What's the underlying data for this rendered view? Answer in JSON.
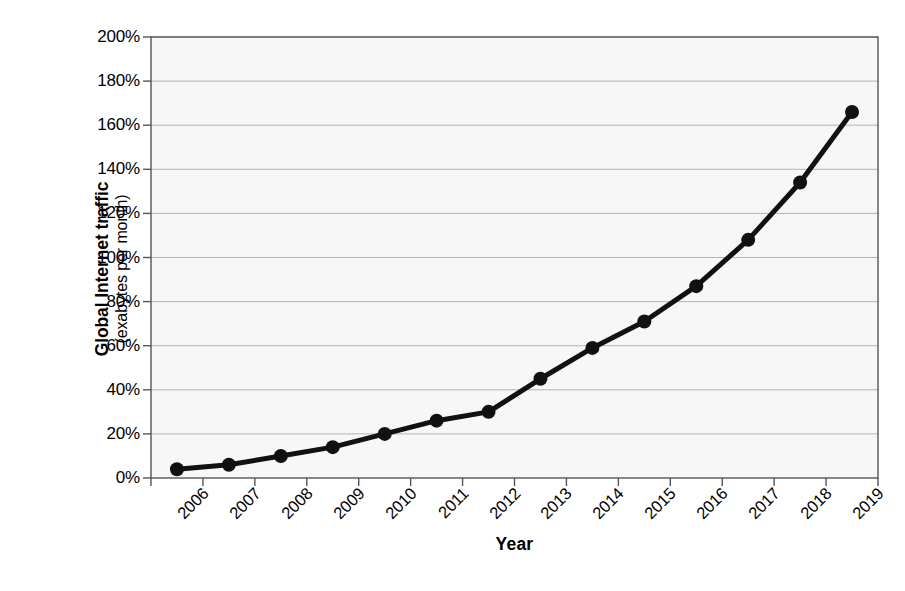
{
  "chart_data": {
    "type": "line",
    "title": "",
    "xlabel": "Year",
    "ylabel_line1": "Global Internet traffic",
    "ylabel_line2": "(exabytes per month)",
    "categories": [
      "2006",
      "2007",
      "2008",
      "2009",
      "2010",
      "2011",
      "2012",
      "2013",
      "2014",
      "2015",
      "2016",
      "2017",
      "2018",
      "2019"
    ],
    "values": [
      4,
      6,
      10,
      14,
      20,
      26,
      30,
      45,
      59,
      71,
      87,
      108,
      134,
      166
    ],
    "value_labels": [
      "4%",
      "6%",
      "10%",
      "14%",
      "20%",
      "26%",
      "30%",
      "45%",
      "59%",
      "71%",
      "87%",
      "108%",
      "134%",
      "166%"
    ],
    "ylim": [
      0,
      200
    ],
    "ytick_values": [
      0,
      20,
      40,
      60,
      80,
      100,
      120,
      140,
      160,
      180,
      200
    ],
    "ytick_labels": [
      "0%",
      "20%",
      "40%",
      "60%",
      "80%",
      "100%",
      "120%",
      "140%",
      "160%",
      "180%",
      "200%"
    ],
    "grid": true,
    "legend": "none",
    "series_name": "Global Internet traffic",
    "colors": {
      "line": "#111111",
      "marker": "#111111",
      "grid": "#b4b4b4",
      "axis": "#555555",
      "plot_background": "#f7f7f7",
      "page_background": "#ffffff",
      "text": "#000000"
    },
    "marker_style": "circle",
    "line_width_px": 5,
    "marker_radius_px": 7
  },
  "plot_geometry": {
    "left": 151,
    "right": 878,
    "top": 37,
    "bottom": 478
  }
}
